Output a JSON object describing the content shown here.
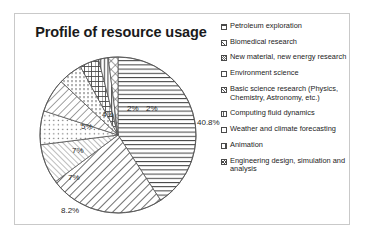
{
  "chart_data": {
    "type": "pie",
    "title": "Profile of resource usage",
    "xlabel": "",
    "ylabel": "",
    "legend_position": "right",
    "grid": false,
    "categories": [
      "Petroleum exploration",
      "Biomedical research",
      "New material, new energy research",
      "Environment science",
      "Basic science research (Physics, Chemistry, Astronomy, etc.)",
      "Computing fluid dynamics",
      "Weather and climate forecasting",
      "Animation",
      "Engineering design, simulation and analysis"
    ],
    "values": [
      40.8,
      24,
      8.2,
      7,
      7,
      5,
      4,
      2,
      2
    ],
    "value_labels": [
      "40.8%",
      "24%",
      "8.2%",
      "7%",
      "7%",
      "5%",
      "4%",
      "2%",
      "2%"
    ],
    "unit": "%",
    "slice_patterns": [
      "horizontal-lines",
      "diagonal-lines-bold",
      "diagonal-lines-fine",
      "dots",
      "diagonal-lines",
      "vertical-dotted",
      "brick",
      "vertical-lines",
      "crosshatch"
    ],
    "start_angle_deg": 0,
    "direction": "clockwise"
  },
  "chart": {
    "title": "Profile of resource usage",
    "labels": [
      {
        "text": "40.8%",
        "left": 158,
        "top": 62
      },
      {
        "text": "24%",
        "left": 92,
        "top": 196
      },
      {
        "text": "8.2%",
        "left": 22,
        "top": 150
      },
      {
        "text": "7%",
        "left": 29,
        "top": 117
      },
      {
        "text": "7%",
        "left": 33,
        "top": 90
      },
      {
        "text": "5%",
        "left": 42,
        "top": 66
      },
      {
        "text": "4%",
        "left": 63,
        "top": 54
      },
      {
        "text": "2%",
        "left": 88,
        "top": 48
      },
      {
        "text": "2%",
        "left": 107,
        "top": 48
      }
    ]
  },
  "legend": {
    "items": [
      {
        "label": "Petroleum exploration",
        "swatch": "sw-horiz",
        "icon": "pattern-horizontal-lines-swatch"
      },
      {
        "label": "Biomedical research",
        "swatch": "sw-diag-bold",
        "icon": "pattern-diagonal-bold-swatch"
      },
      {
        "label": "New material, new energy research",
        "swatch": "sw-diag-fine",
        "icon": "pattern-diagonal-fine-swatch"
      },
      {
        "label": "Environment science",
        "swatch": "sw-dots",
        "icon": "pattern-dots-swatch"
      },
      {
        "label": "Basic science research (Physics, Chemistry, Astronomy, etc.)",
        "swatch": "sw-diag2",
        "icon": "pattern-diagonal-swatch"
      },
      {
        "label": "Computing fluid dynamics",
        "swatch": "sw-vdots",
        "icon": "pattern-vertical-dotted-swatch"
      },
      {
        "label": "Weather and climate forecasting",
        "swatch": "sw-brick",
        "icon": "pattern-brick-swatch"
      },
      {
        "label": "Animation",
        "swatch": "sw-vert",
        "icon": "pattern-vertical-lines-swatch"
      },
      {
        "label": "Engineering design, simulation and analysis",
        "swatch": "sw-cross",
        "icon": "pattern-crosshatch-swatch"
      }
    ]
  },
  "colors": {
    "ink": "#1a1a1a",
    "pattern": "#4a4a4a",
    "border": "#c9c9c9",
    "background": "#ffffff"
  }
}
